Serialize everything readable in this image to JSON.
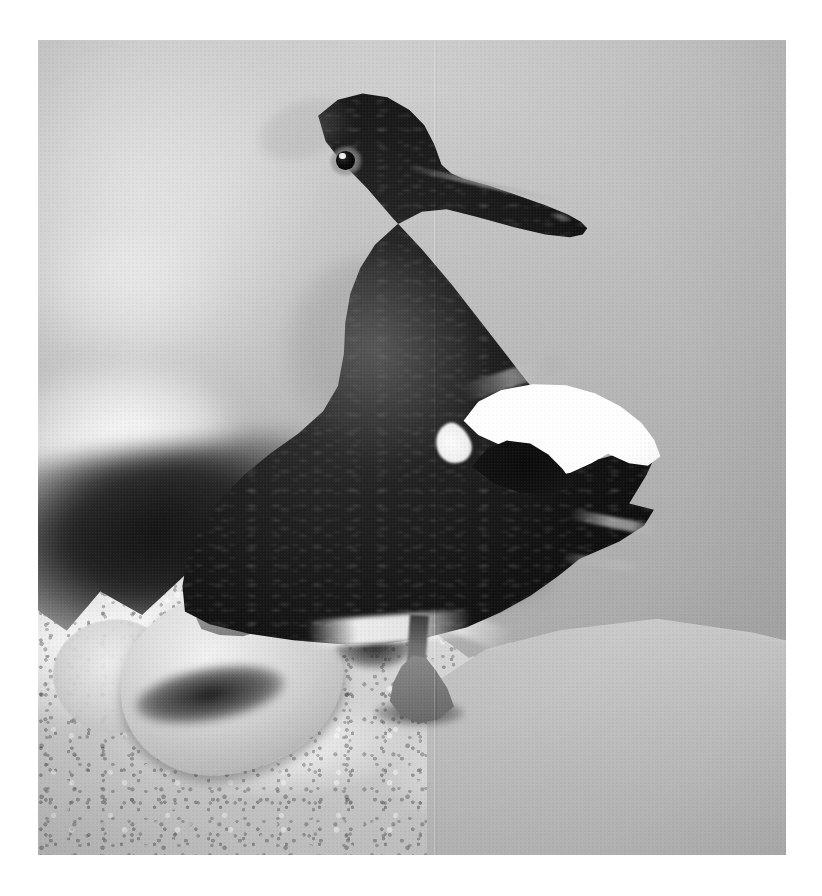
{
  "page": {
    "background_color": "#ffffff",
    "width": 822,
    "height": 896
  },
  "photograph": {
    "caption": "Black Guillemot perched on a rocky ledge",
    "medium": "black-and-white photograph",
    "frame": {
      "left": 38,
      "top": 40,
      "width": 748,
      "height": 815
    },
    "palette": {
      "sky_light": "#d7d7d7",
      "sky_mid": "#bdbdbd",
      "sky_dark": "#a6a6a6",
      "plumage_black": "#111111",
      "wing_patch_white": "#ffffff",
      "rock_light": "#d8d8d8",
      "rock_mid": "#c4c4c4",
      "foot_grey": "#7e7e7e",
      "shadow_black": "#0a0a0a"
    },
    "subject": {
      "name": "black-guillemot",
      "pose": "standing in profile, head turned to the right",
      "parts": [
        {
          "name": "head",
          "tone": "black"
        },
        {
          "name": "eye",
          "tone": "black with pale grey eye-ring and white catchlight"
        },
        {
          "name": "beak",
          "tone": "black, slender, slightly upturned tip"
        },
        {
          "name": "neck",
          "tone": "black"
        },
        {
          "name": "breast",
          "tone": "black"
        },
        {
          "name": "wing-patch",
          "tone": "bright white oval with black notch"
        },
        {
          "name": "tail",
          "tone": "black, pointed primaries splayed"
        },
        {
          "name": "leg",
          "tone": "mid grey"
        },
        {
          "name": "foot",
          "tone": "mid grey, webbed"
        }
      ]
    },
    "background": {
      "name": "out-of-focus sky and distant rock",
      "description": "smooth grey gradient, lighter top-left, darker lower-right, with blurred pale blobs and a dark shadow band at mid-left"
    },
    "foreground": {
      "name": "rocky-ledge",
      "description": "coarse, guano-streaked rock with bright highlights, deep crevice shadows and a sloping face on the right"
    },
    "artifacts": [
      {
        "name": "scan-seam",
        "description": "faint vertical scan line near the centre of the frame"
      },
      {
        "name": "film-grain",
        "description": "fine photographic grain across the whole print"
      }
    ]
  }
}
